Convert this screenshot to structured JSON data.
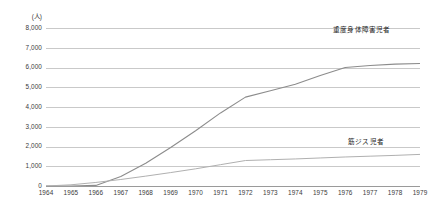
{
  "chart_data": {
    "type": "line",
    "title": "",
    "subtitle": "",
    "xlabel": "",
    "ylabel": "",
    "unit_label": "(人)",
    "grid": true,
    "legend_position": "inline-annotation",
    "xlim": [
      1964,
      1979
    ],
    "ylim": [
      0,
      8000
    ],
    "ytick_step": 1000,
    "x": [
      1964,
      1965,
      1966,
      1967,
      1968,
      1969,
      1970,
      1971,
      1972,
      1973,
      1974,
      1975,
      1976,
      1977,
      1978,
      1979
    ],
    "xtick_labels": [
      "1964",
      "1965",
      "1966",
      "1967",
      "1968",
      "1969",
      "1970",
      "1971",
      "1972",
      "1973",
      "1974",
      "1975",
      "1976",
      "1977",
      "1978",
      "1979"
    ],
    "ytick_labels": [
      "8,000",
      "7,000",
      "6,000",
      "5,000",
      "4,000",
      "3,000",
      "2,000",
      "1,000",
      "0"
    ],
    "ytick_values": [
      8000,
      7000,
      6000,
      5000,
      4000,
      3000,
      2000,
      1000,
      0
    ],
    "series": [
      {
        "name": "重度身体障害児者",
        "color": "#8c8c8c",
        "values": [
          0,
          0,
          30,
          480,
          1150,
          1950,
          2800,
          3700,
          4500,
          4820,
          5150,
          5600,
          6000,
          6100,
          6170,
          6200
        ]
      },
      {
        "name": "筋ジス児者",
        "color": "#b0b0b0",
        "values": [
          0,
          60,
          180,
          330,
          500,
          680,
          870,
          1080,
          1290,
          1330,
          1370,
          1420,
          1470,
          1510,
          1550,
          1600
        ]
      }
    ],
    "annotations": [
      {
        "name": "重度身体障害児者",
        "target_series": 0
      },
      {
        "name": "筋ジス児者",
        "target_series": 1
      }
    ]
  }
}
